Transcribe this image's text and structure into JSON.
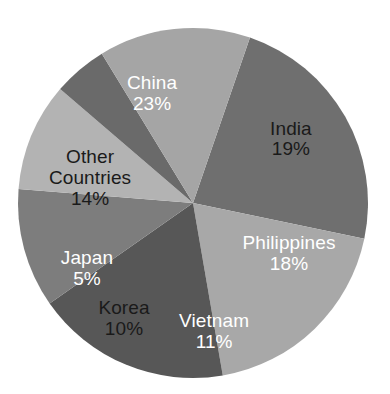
{
  "chart_data": {
    "type": "pie",
    "title": "",
    "subtitle": "",
    "xlabel": "",
    "ylabel": "",
    "grid": false,
    "legend_position": "none",
    "labels_inside_slices": true,
    "value_unit": "%",
    "total": 100,
    "categories": [
      "China",
      "India",
      "Philippines",
      "Vietnam",
      "Korea",
      "Japan",
      "Other Countries"
    ],
    "values": [
      23,
      19,
      18,
      11,
      10,
      5,
      14
    ],
    "slices": [
      {
        "name": "China",
        "label_line1": "China",
        "label_line2": "23%",
        "value": 23,
        "color": "#6f6f6f",
        "text_color": "#ffffff",
        "label_x_pct": 39.0,
        "label_y_pct": 23.9
      },
      {
        "name": "India",
        "label_line1": "India",
        "label_line2": "19%",
        "value": 19,
        "color": "#a8a8a8",
        "text_color": "#1a1a1a",
        "label_x_pct": 74.6,
        "label_y_pct": 35.5
      },
      {
        "name": "Philippines",
        "label_line1": "Philippines",
        "label_line2": "18%",
        "value": 18,
        "color": "#575757",
        "text_color": "#ffffff",
        "label_x_pct": 74.1,
        "label_y_pct": 64.5
      },
      {
        "name": "Vietnam",
        "label_line1": "Vietnam",
        "label_line2": "11%",
        "value": 11,
        "color": "#7d7d7d",
        "text_color": "#ffffff",
        "label_x_pct": 54.9,
        "label_y_pct": 84.3
      },
      {
        "name": "Korea",
        "label_line1": "Korea",
        "label_line2": "10%",
        "value": 10,
        "color": "#b3b3b3",
        "text_color": "#1a1a1a",
        "label_x_pct": 31.8,
        "label_y_pct": 81.0
      },
      {
        "name": "Japan",
        "label_line1": "Japan",
        "label_line2": "5%",
        "value": 5,
        "color": "#6a6a6a",
        "text_color": "#ffffff",
        "label_x_pct": 22.3,
        "label_y_pct": 68.3
      },
      {
        "name": "Other Countries",
        "label_line1": "Other",
        "label_line2": "Countries",
        "label_line3": "14%",
        "value": 14,
        "color": "#a5a5a5",
        "text_color": "#1a1a1a",
        "label_x_pct": 23.1,
        "label_y_pct": 45.2
      }
    ],
    "geometry": {
      "center_x": 193,
      "center_y": 203,
      "radius": 175,
      "start_angle_deg": -71
    },
    "background_color": "#ffffff"
  }
}
